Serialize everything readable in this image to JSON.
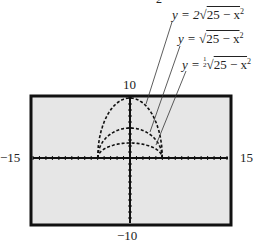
{
  "chart_data": {
    "type": "line",
    "title": "",
    "xlabel": "",
    "ylabel": "",
    "xlim": [
      -15,
      15
    ],
    "ylim": [
      -10,
      10
    ],
    "grid": false,
    "window_labels": {
      "xmin": "−15",
      "xmax": "15",
      "ymin": "−10",
      "ymax": "10"
    },
    "series": [
      {
        "name": "y = 2√(25 − x²)",
        "domain": [
          -5,
          5
        ],
        "peak": 10,
        "x": [
          -5,
          -4,
          -3,
          -2,
          -1,
          0,
          1,
          2,
          3,
          4,
          5
        ],
        "y": [
          0,
          6,
          8,
          9.17,
          9.8,
          10,
          9.8,
          9.17,
          8,
          6,
          0
        ]
      },
      {
        "name": "y = √(25 − x²)",
        "domain": [
          -5,
          5
        ],
        "peak": 5,
        "x": [
          -5,
          -4,
          -3,
          -2,
          -1,
          0,
          1,
          2,
          3,
          4,
          5
        ],
        "y": [
          0,
          3,
          4,
          4.58,
          4.9,
          5,
          4.9,
          4.58,
          4,
          3,
          0
        ]
      },
      {
        "name": "y = ½√(25 − x²)",
        "domain": [
          -5,
          5
        ],
        "peak": 2.5,
        "x": [
          -5,
          -4,
          -3,
          -2,
          -1,
          0,
          1,
          2,
          3,
          4,
          5
        ],
        "y": [
          0,
          1.5,
          2,
          2.29,
          2.45,
          2.5,
          2.45,
          2.29,
          2,
          1.5,
          0
        ]
      }
    ],
    "annotations": [
      "y = 2√(25 − x²)",
      "y = √(25 − x²)",
      "y = ½√(25 − x²)"
    ]
  },
  "labels": {
    "top_fragment": "2",
    "curve1": {
      "prefix": "y = 2",
      "radicand": "25 − x",
      "exp": "2"
    },
    "curve2": {
      "prefix": "y = ",
      "radicand": "25 − x",
      "exp": "2"
    },
    "curve3": {
      "prefix": "y = ",
      "frac_num": "1",
      "frac_den": "2",
      "radicand": "25 − x",
      "exp": "2"
    },
    "ymax": "10",
    "ymin": "−10",
    "xmin": "−15",
    "xmax": "15"
  },
  "colors": {
    "screen_bg": "#e6e6e6",
    "frame": "#111111",
    "ink": "#222222"
  }
}
